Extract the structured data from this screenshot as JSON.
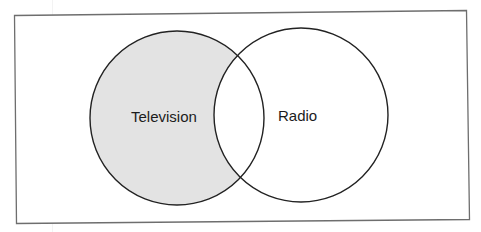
{
  "diagram": {
    "type": "venn",
    "frame": {
      "stroke": "#6e6e6e",
      "background": "#ffffff"
    },
    "sets": [
      {
        "id": "television",
        "label": "Television",
        "fill": "#e3e3e3",
        "stroke": "#222222",
        "highlighted": true
      },
      {
        "id": "radio",
        "label": "Radio",
        "fill": "#ffffff",
        "stroke": "#222222",
        "highlighted": false
      }
    ],
    "shaded_region": "Television only (Television minus Radio)"
  }
}
